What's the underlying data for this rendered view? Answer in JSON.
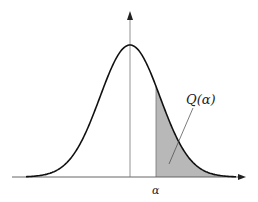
{
  "diagram": {
    "labels": {
      "threshold": "α",
      "tail_area": "Q(α)"
    },
    "colors": {
      "curve": "#111111",
      "axes": "#555555",
      "shade": "#b8b8b8"
    },
    "geometry": {
      "mean_x": 130,
      "threshold_x": 156,
      "baseline_y": 177,
      "peak_y": 45
    }
  }
}
